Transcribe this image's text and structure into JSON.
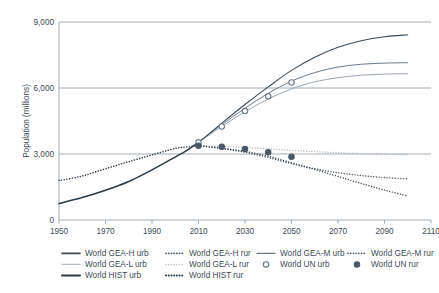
{
  "chart_data": {
    "type": "line",
    "title": "",
    "xlabel": "",
    "ylabel": "Population (millions)",
    "xlim": [
      1950,
      2110
    ],
    "ylim": [
      0,
      9000
    ],
    "xticks": [
      1950,
      1970,
      1990,
      2010,
      2030,
      2050,
      2070,
      2090,
      2110
    ],
    "yticks": [
      0,
      3000,
      6000,
      9000
    ],
    "ytick_labels": [
      "0",
      "3,000",
      "6,000",
      "9,000"
    ],
    "grid": "horizontal",
    "legend_position": "bottom",
    "series": [
      {
        "name": "World HIST urb",
        "style": "solid",
        "color": "#2b3a47",
        "width": 1.5,
        "x": [
          1950,
          1960,
          1970,
          1980,
          1990,
          2000,
          2005,
          2010
        ],
        "values": [
          750,
          1020,
          1350,
          1750,
          2280,
          2860,
          3160,
          3530
        ]
      },
      {
        "name": "World HIST rur",
        "style": "dotted",
        "color": "#2b3a47",
        "width": 1.5,
        "x": [
          1950,
          1960,
          1970,
          1980,
          1990,
          2000,
          2005,
          2010
        ],
        "values": [
          1790,
          2000,
          2330,
          2650,
          2960,
          3250,
          3320,
          3380
        ]
      },
      {
        "name": "World GEA-H urb",
        "style": "solid",
        "color": "#3c4b57",
        "width": 1.1,
        "x": [
          2010,
          2020,
          2030,
          2040,
          2050,
          2060,
          2070,
          2080,
          2090,
          2100
        ],
        "values": [
          3530,
          4400,
          5250,
          6050,
          6800,
          7400,
          7850,
          8150,
          8330,
          8420
        ]
      },
      {
        "name": "World GEA-H rur",
        "style": "dotted",
        "color": "#3c4b57",
        "width": 1.4,
        "x": [
          2010,
          2020,
          2030,
          2040,
          2050,
          2060,
          2070,
          2080,
          2090,
          2100
        ],
        "values": [
          3380,
          3260,
          3120,
          2900,
          2600,
          2300,
          1980,
          1660,
          1360,
          1090
        ]
      },
      {
        "name": "World GEA-M urb",
        "style": "solid",
        "color": "#6b7a87",
        "width": 1.0,
        "x": [
          2010,
          2020,
          2030,
          2040,
          2050,
          2060,
          2070,
          2080,
          2090,
          2100
        ],
        "values": [
          3530,
          4330,
          5080,
          5760,
          6310,
          6700,
          6950,
          7080,
          7130,
          7150
        ]
      },
      {
        "name": "World GEA-M rur",
        "style": "dotted",
        "color": "#4a5965",
        "width": 1.4,
        "x": [
          2010,
          2020,
          2030,
          2040,
          2050,
          2060,
          2070,
          2080,
          2090,
          2100
        ],
        "values": [
          3380,
          3250,
          3080,
          2840,
          2560,
          2330,
          2150,
          2020,
          1930,
          1870
        ]
      },
      {
        "name": "World GEA-L urb",
        "style": "solid",
        "color": "#9aa6b1",
        "width": 1.0,
        "x": [
          2010,
          2020,
          2030,
          2040,
          2050,
          2060,
          2070,
          2080,
          2090,
          2100
        ],
        "values": [
          3530,
          4250,
          4920,
          5500,
          5960,
          6280,
          6470,
          6580,
          6630,
          6650
        ]
      },
      {
        "name": "World GEA-L rur",
        "style": "dotted",
        "color": "#aab4bd",
        "width": 1.3,
        "x": [
          2010,
          2020,
          2030,
          2040,
          2050,
          2060,
          2070,
          2080,
          2090,
          2100
        ],
        "values": [
          3380,
          3340,
          3300,
          3240,
          3170,
          3110,
          3060,
          3020,
          2990,
          2970
        ]
      },
      {
        "name": "World UN urb",
        "style": "markers",
        "marker": "open-circle",
        "color": "#6b7a87",
        "x": [
          2010,
          2020,
          2030,
          2040,
          2050
        ],
        "values": [
          3530,
          4250,
          4950,
          5620,
          6250
        ]
      },
      {
        "name": "World UN rur",
        "style": "markers",
        "marker": "filled-circle",
        "color": "#4a5965",
        "x": [
          2010,
          2020,
          2030,
          2040,
          2050
        ],
        "values": [
          3380,
          3330,
          3230,
          3080,
          2880
        ]
      }
    ],
    "legend": [
      {
        "label": "World GEA-H urb",
        "swatch": "solid",
        "color": "#3c4b57",
        "width": 1.6
      },
      {
        "label": "World GEA-H rur",
        "swatch": "dotted",
        "color": "#3c4b57",
        "width": 1.6
      },
      {
        "label": "World GEA-M urb",
        "swatch": "solid",
        "color": "#6b7a87",
        "width": 1.2
      },
      {
        "label": "World GEA-M rur",
        "swatch": "dotted",
        "color": "#4a5965",
        "width": 1.6
      },
      {
        "label": "World GEA-L urb",
        "swatch": "solid",
        "color": "#b4bec6",
        "width": 1.2
      },
      {
        "label": "World GEA-L rur",
        "swatch": "dotted",
        "color": "#b4bec6",
        "width": 1.4
      },
      {
        "label": "World UN urb",
        "swatch": "open-circle",
        "color": "#6b7a87",
        "width": 1
      },
      {
        "label": "World UN rur",
        "swatch": "filled-circle",
        "color": "#4a5965",
        "width": 1
      },
      {
        "label": "World HIST urb",
        "swatch": "solid",
        "color": "#2b3a47",
        "width": 2
      },
      {
        "label": "World HIST rur",
        "swatch": "dotted",
        "color": "#2b3a47",
        "width": 2
      }
    ]
  }
}
